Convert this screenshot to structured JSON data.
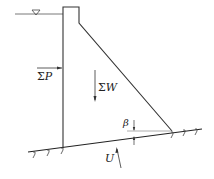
{
  "diagram": {
    "colors": {
      "stroke": "#333333",
      "background": "#ffffff"
    },
    "water_level_symbol": "▽",
    "labels": {
      "horizontal_force": {
        "sigma": "Σ",
        "symbol": "P"
      },
      "vertical_force": {
        "sigma": "Σ",
        "symbol": "W"
      },
      "uplift": "U",
      "angle": "β"
    }
  }
}
